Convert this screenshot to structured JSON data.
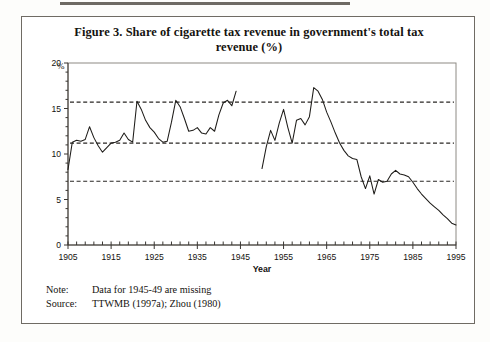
{
  "figure": {
    "title": "Figure 3. Share of cigarette tax revenue in government's total tax revenue (%)",
    "note_label": "Note:",
    "note_text": "Data for 1945-49 are missing",
    "source_label": "Source:",
    "source_text": "TTWMB (1997a); Zhou (1980)"
  },
  "chart_data": {
    "type": "line",
    "title": "Figure 3. Share of cigarette tax revenue in government's total tax revenue (%)",
    "xlabel": "Year",
    "ylabel": "%",
    "xlim": [
      1905,
      1995
    ],
    "ylim": [
      0,
      20
    ],
    "yticks": [
      0,
      5,
      10,
      15,
      20
    ],
    "ytick_labels": [
      "0",
      "5",
      "10",
      "15",
      "20"
    ],
    "xticks": [
      1905,
      1915,
      1925,
      1935,
      1945,
      1955,
      1965,
      1975,
      1985,
      1995
    ],
    "xtick_labels": [
      "1905",
      "1915",
      "1925",
      "1935",
      "1945",
      "1955",
      "1965",
      "1975",
      "1985",
      "1995"
    ],
    "minor_xtick_step": 2,
    "grid": false,
    "legend": "none",
    "reference_lines": [
      {
        "value": 15.7,
        "style": "dashed"
      },
      {
        "value": 11.2,
        "style": "dashed"
      },
      {
        "value": 7.0,
        "style": "dashed"
      }
    ],
    "missing_years": [
      1945,
      1946,
      1947,
      1948,
      1949
    ],
    "series": [
      {
        "name": "Share of cigarette tax revenue (%)",
        "x": [
          1905,
          1906,
          1907,
          1908,
          1909,
          1910,
          1911,
          1912,
          1913,
          1914,
          1915,
          1916,
          1917,
          1918,
          1919,
          1920,
          1921,
          1922,
          1923,
          1924,
          1925,
          1926,
          1927,
          1928,
          1929,
          1930,
          1931,
          1932,
          1933,
          1934,
          1935,
          1936,
          1937,
          1938,
          1939,
          1940,
          1941,
          1942,
          1943,
          1944,
          1950,
          1951,
          1952,
          1953,
          1954,
          1955,
          1956,
          1957,
          1958,
          1959,
          1960,
          1961,
          1962,
          1963,
          1964,
          1965,
          1966,
          1967,
          1968,
          1969,
          1970,
          1971,
          1972,
          1973,
          1974,
          1975,
          1976,
          1977,
          1978,
          1979,
          1980,
          1981,
          1982,
          1983,
          1984,
          1985,
          1986,
          1987,
          1988,
          1989,
          1990,
          1991,
          1992,
          1993,
          1994,
          1995
        ],
        "y": [
          8.3,
          11.3,
          11.5,
          11.4,
          11.6,
          13.0,
          11.8,
          10.9,
          10.2,
          10.7,
          11.2,
          11.3,
          11.5,
          12.3,
          11.6,
          11.3,
          15.8,
          14.9,
          13.7,
          12.9,
          12.4,
          11.7,
          11.3,
          11.4,
          13.5,
          15.9,
          15.2,
          13.9,
          12.5,
          12.6,
          12.9,
          12.3,
          12.2,
          12.9,
          12.5,
          14.3,
          15.6,
          15.9,
          15.3,
          16.9,
          8.4,
          10.8,
          12.6,
          11.5,
          13.4,
          14.9,
          12.9,
          11.2,
          13.7,
          13.9,
          13.2,
          14.1,
          17.3,
          16.9,
          16.0,
          14.6,
          13.5,
          12.3,
          11.2,
          10.4,
          9.8,
          9.5,
          9.4,
          7.5,
          6.2,
          7.6,
          5.6,
          7.2,
          6.9,
          7.0,
          7.8,
          8.2,
          7.8,
          7.7,
          7.5,
          6.9,
          6.2,
          5.6,
          5.1,
          4.6,
          4.2,
          3.8,
          3.3,
          2.9,
          2.4,
          2.2
        ]
      }
    ]
  }
}
